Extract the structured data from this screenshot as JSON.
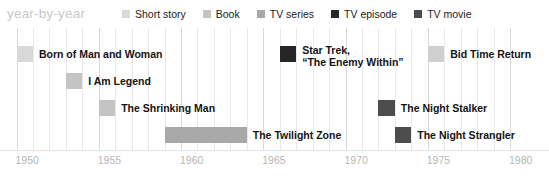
{
  "chart_title": "year-by-year",
  "legend": {
    "items": [
      {
        "label": "Short story",
        "color": "#d9d9d9",
        "key": "short_story"
      },
      {
        "label": "Book",
        "color": "#c4c4c4",
        "key": "book"
      },
      {
        "label": "TV series",
        "color": "#a8a8a8",
        "key": "tv_series"
      },
      {
        "label": "TV episode",
        "color": "#262626",
        "key": "tv_episode"
      },
      {
        "label": "TV movie",
        "color": "#4d4d4d",
        "key": "tv_movie"
      }
    ]
  },
  "chart_data": {
    "type": "bar",
    "orientation": "horizontal-timeline",
    "title": "year-by-year",
    "xlabel": "",
    "ylabel": "",
    "xlim": [
      1950,
      1980
    ],
    "grid": true,
    "grid_step": 1,
    "tick_step": 5,
    "tick_labels": [
      "1950",
      "1955",
      "1960",
      "1965",
      "1970",
      "1975",
      "1980"
    ],
    "tick_values": [
      1950,
      1955,
      1960,
      1965,
      1970,
      1975,
      1980
    ],
    "legend_position": "top",
    "categories": [
      "Born of Man and Woman",
      "I Am Legend",
      "The Shrinking Man",
      "The Twilight Zone",
      "Star Trek, \"The Enemy Within\"",
      "Bid Time Return",
      "The Night Stalker",
      "The Night Strangler"
    ],
    "bars": [
      {
        "label": "Born of Man and Woman",
        "label_line1": "Born of Man and Woman",
        "label_line2": "",
        "type": "Short story",
        "color": "#d9d9d9",
        "start": 1950,
        "end": 1951,
        "row": 0
      },
      {
        "label": "I Am Legend",
        "label_line1": "I Am Legend",
        "label_line2": "",
        "type": "Book",
        "color": "#c4c4c4",
        "start": 1953,
        "end": 1954,
        "row": 1
      },
      {
        "label": "The Shrinking Man",
        "label_line1": "The Shrinking Man",
        "label_line2": "",
        "type": "Book",
        "color": "#c4c4c4",
        "start": 1955,
        "end": 1956,
        "row": 2
      },
      {
        "label": "The Twilight Zone",
        "label_line1": "The Twilight Zone",
        "label_line2": "",
        "type": "TV series",
        "color": "#a8a8a8",
        "start": 1959,
        "end": 1964,
        "row": 3
      },
      {
        "label": "Star Trek, \"The Enemy Within\"",
        "label_line1": "Star Trek,",
        "label_line2": "“The Enemy Within”",
        "type": "TV episode",
        "color": "#262626",
        "start": 1966,
        "end": 1967,
        "row": 0
      },
      {
        "label": "Bid Time Return",
        "label_line1": "Bid Time Return",
        "label_line2": "",
        "type": "Book",
        "color": "#cfcfcf",
        "start": 1975,
        "end": 1976,
        "row": 0
      },
      {
        "label": "The Night Stalker",
        "label_line1": "The Night Stalker",
        "label_line2": "",
        "type": "TV movie",
        "color": "#4d4d4d",
        "start": 1972,
        "end": 1973,
        "row": 2
      },
      {
        "label": "The Night Strangler",
        "label_line1": "The Night Strangler",
        "label_line2": "",
        "type": "TV movie",
        "color": "#4d4d4d",
        "start": 1973,
        "end": 1974,
        "row": 3
      }
    ]
  }
}
